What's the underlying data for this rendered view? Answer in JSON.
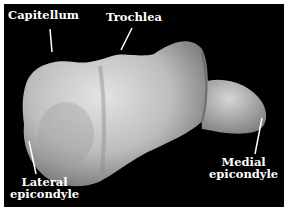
{
  "figure": {
    "background_color": "#000000",
    "bone_color": "#c8c8c8",
    "label_color": "#ffffff"
  },
  "labels": {
    "capitellum": "Capitellum",
    "trochlea": "Trochlea",
    "lateral_epicondyle": {
      "line1": "Lateral",
      "line2": "epicondyle"
    },
    "medial_epicondyle": {
      "line1": "Medial",
      "line2": "epicondyle"
    }
  }
}
